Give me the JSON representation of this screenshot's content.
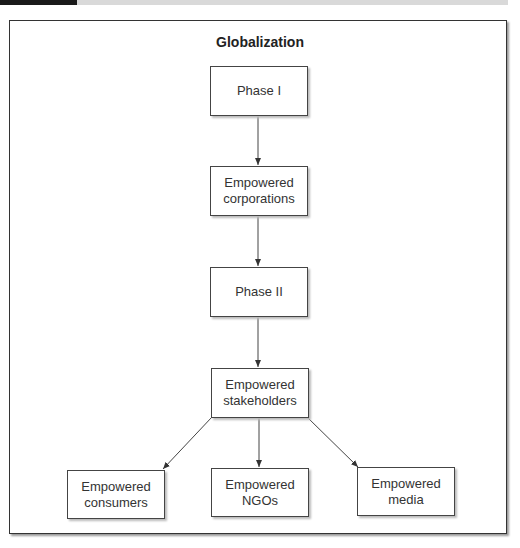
{
  "diagram": {
    "title": "Globalization",
    "nodes": {
      "phase1": "Phase I",
      "corporations": [
        "Empowered",
        "corporations"
      ],
      "phase2": "Phase II",
      "stakeholders": [
        "Empowered",
        "stakeholders"
      ],
      "consumers": [
        "Empowered",
        "consumers"
      ],
      "ngos": [
        "Empowered",
        "NGOs"
      ],
      "media": [
        "Empowered",
        "media"
      ]
    },
    "edges": [
      [
        "Phase I",
        "Empowered corporations"
      ],
      [
        "Empowered corporations",
        "Phase II"
      ],
      [
        "Phase II",
        "Empowered stakeholders"
      ],
      [
        "Empowered stakeholders",
        "Empowered consumers"
      ],
      [
        "Empowered stakeholders",
        "Empowered NGOs"
      ],
      [
        "Empowered stakeholders",
        "Empowered media"
      ]
    ]
  }
}
